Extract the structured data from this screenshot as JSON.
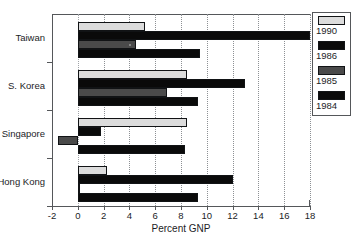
{
  "chart_data": {
    "type": "bar",
    "orientation": "horizontal",
    "title": "",
    "xlabel": "Percent GNP",
    "ylabel": "",
    "xlim": [
      -2,
      18
    ],
    "xticks": [
      -2,
      0,
      2,
      4,
      6,
      8,
      10,
      12,
      14,
      16,
      18
    ],
    "xtick_labels": [
      "-2",
      "0",
      "2",
      "4",
      "6",
      "8",
      "10",
      "12",
      "14",
      "16",
      "18"
    ],
    "grid": true,
    "grid_axis": "x",
    "legend_position": "outside-right",
    "categories": [
      "Taiwan",
      "S. Korea",
      "Singapore",
      "Hong Kong"
    ],
    "series": [
      {
        "name": "1990",
        "color": "#dcdcdc",
        "values": [
          5.2,
          8.5,
          8.5,
          2.3
        ]
      },
      {
        "name": "1986",
        "color": "#0a0a0a",
        "values": [
          18.0,
          13.0,
          1.8,
          12.0
        ]
      },
      {
        "name": "1985",
        "color": "#4a4a4a",
        "values": [
          4.5,
          6.9,
          -1.5,
          0.05
        ]
      },
      {
        "name": "1984",
        "color": "#0a0a0a",
        "values": [
          9.5,
          9.3,
          8.3,
          9.3
        ]
      }
    ]
  },
  "axes": {
    "x_title": "Percent GNP",
    "x_tick_labels": [
      "-2",
      "0",
      "2",
      "4",
      "6",
      "8",
      "10",
      "12",
      "14",
      "16",
      "18"
    ],
    "y_category_labels": [
      "Taiwan",
      "S. Korea",
      "Singapore",
      "Hong Kong"
    ]
  },
  "legend": {
    "entries": [
      {
        "label": "1990",
        "color": "#dcdcdc"
      },
      {
        "label": "1986",
        "color": "#0a0a0a"
      },
      {
        "label": "1985",
        "color": "#4a4a4a"
      },
      {
        "label": "1984",
        "color": "#0a0a0a"
      }
    ]
  },
  "colors": {
    "axis": "#55575a",
    "grid": "#8d9094",
    "text": "#1c1d1f",
    "background": "#ffffff"
  }
}
